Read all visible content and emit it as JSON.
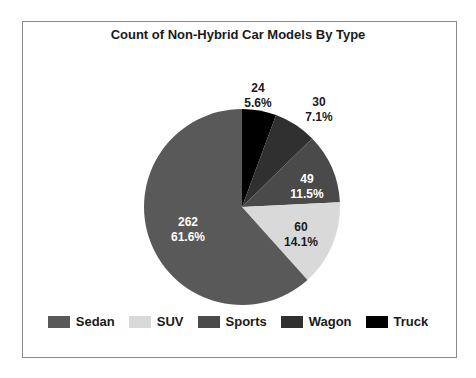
{
  "chart_data": {
    "type": "pie",
    "title": "Count of Non-Hybrid Car Models By Type",
    "categories": [
      "Sedan",
      "SUV",
      "Sports",
      "Wagon",
      "Truck"
    ],
    "values": [
      262,
      60,
      49,
      30,
      24
    ],
    "percentages": [
      "61.6%",
      "14.1%",
      "11.5%",
      "7.1%",
      "5.6%"
    ],
    "colors": [
      "#595959",
      "#d9d9d9",
      "#4a4a4a",
      "#303030",
      "#000000"
    ],
    "label_colors": [
      "#ffffff",
      "#1a1a1a",
      "#ffffff",
      "#1a1a1a",
      "#1a1a1a"
    ],
    "start_angle_deg": 90,
    "direction": "counterclockwise-from-top-drawing-order-reversed",
    "legend_position": "bottom",
    "grid": false
  },
  "legend": {
    "items": [
      {
        "label": "Sedan",
        "color": "#595959"
      },
      {
        "label": "SUV",
        "color": "#d9d9d9"
      },
      {
        "label": "Sports",
        "color": "#4a4a4a"
      },
      {
        "label": "Wagon",
        "color": "#303030"
      },
      {
        "label": "Truck",
        "color": "#000000"
      }
    ]
  }
}
